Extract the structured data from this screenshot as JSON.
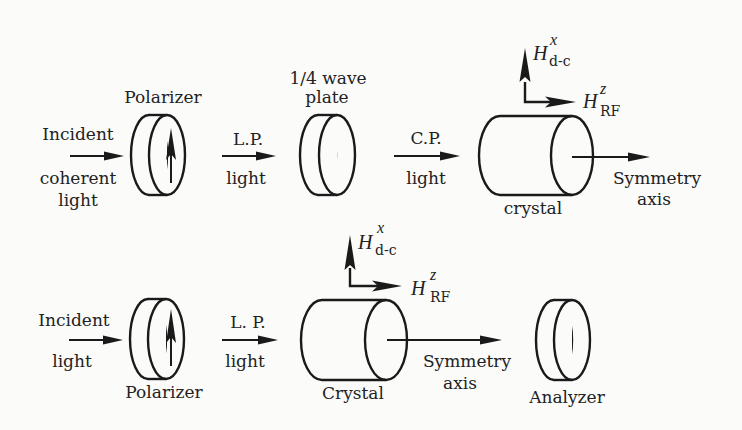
{
  "diagram": {
    "type": "optical-setup-schematic",
    "top_row": {
      "input_label_1": "Incident",
      "input_label_2": "coherent",
      "input_label_3": "light",
      "polarizer_label": "Polarizer",
      "lp_label_1": "L.P.",
      "lp_label_2": "light",
      "waveplate_label_1": "1/4 wave",
      "waveplate_label_2": "plate",
      "cp_label_1": "C.P.",
      "cp_label_2": "light",
      "crystal_label": "crystal",
      "axis_label_1": "Symmetry",
      "axis_label_2": "axis",
      "field_dc": {
        "symbol": "H",
        "superscript": "x",
        "subscript": "d-c"
      },
      "field_rf": {
        "symbol": "H",
        "superscript": "z",
        "subscript": "RF"
      }
    },
    "bottom_row": {
      "input_label_1": "Incident",
      "input_label_2": "light",
      "polarizer_label": "Polarizer",
      "lp_label_1": "L. P.",
      "lp_label_2": "light",
      "crystal_label": "Crystal",
      "axis_label_1": "Symmetry",
      "axis_label_2": "axis",
      "analyzer_label": "Analyzer",
      "field_dc": {
        "symbol": "H",
        "superscript": "x",
        "subscript": "d-c"
      },
      "field_rf": {
        "symbol": "H",
        "superscript": "z",
        "subscript": "RF"
      }
    }
  }
}
